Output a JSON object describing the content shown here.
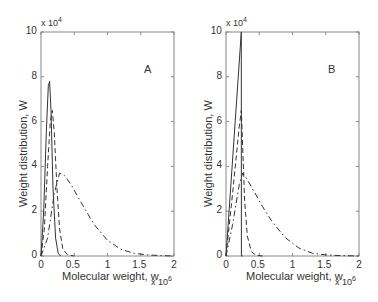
{
  "chart_data": [
    {
      "type": "line",
      "panel_label": "A",
      "xlabel": "Molecular weight, w",
      "x_multiplier": "x 10^6",
      "ylabel": "Weight distribution, W",
      "y_multiplier": "x 10^4",
      "xlim": [
        0,
        2
      ],
      "ylim": [
        0,
        10
      ],
      "xticks": [
        "0",
        "0.5",
        "1",
        "1.5",
        "2"
      ],
      "yticks": [
        "0",
        "2",
        "4",
        "6",
        "8",
        "10"
      ],
      "grid": false,
      "series": [
        {
          "name": "solid",
          "style": "solid",
          "x": [
            0,
            0.04,
            0.08,
            0.11,
            0.13,
            0.15,
            0.18,
            0.22,
            0.26,
            0.3
          ],
          "y": [
            0,
            2.0,
            5.5,
            7.6,
            7.8,
            6.5,
            3.0,
            0.8,
            0.1,
            0
          ]
        },
        {
          "name": "dashed",
          "style": "dashed",
          "x": [
            0,
            0.05,
            0.1,
            0.14,
            0.17,
            0.2,
            0.24,
            0.28,
            0.33,
            0.4,
            0.5
          ],
          "y": [
            0,
            1.2,
            4.0,
            6.0,
            6.5,
            5.5,
            3.0,
            1.2,
            0.3,
            0.05,
            0
          ]
        },
        {
          "name": "dash-dot",
          "style": "dashdot",
          "x": [
            0,
            0.1,
            0.2,
            0.28,
            0.35,
            0.45,
            0.6,
            0.8,
            1.0,
            1.2,
            1.4,
            1.6,
            1.8,
            2.0
          ],
          "y": [
            0,
            0.8,
            2.8,
            3.7,
            3.6,
            3.2,
            2.4,
            1.4,
            0.7,
            0.3,
            0.12,
            0.05,
            0.02,
            0
          ]
        }
      ]
    },
    {
      "type": "line",
      "panel_label": "B",
      "xlabel": "Molecular weight, w",
      "x_multiplier": "x 10^6",
      "ylabel": "Weight distribution, W",
      "y_multiplier": "x 10^4",
      "xlim": [
        0,
        2
      ],
      "ylim": [
        0,
        10
      ],
      "xticks": [
        "0",
        "0.5",
        "1",
        "1.5",
        "2"
      ],
      "yticks": [
        "0",
        "2",
        "4",
        "6",
        "8",
        "10"
      ],
      "grid": false,
      "series": [
        {
          "name": "solid",
          "style": "solid",
          "x": [
            0,
            0.23,
            0.231,
            0.25
          ],
          "y": [
            0,
            10.0,
            0,
            0
          ]
        },
        {
          "name": "dashed",
          "style": "dashed",
          "x": [
            0,
            0.1,
            0.2,
            0.23,
            0.25,
            0.28,
            0.32,
            0.38,
            0.45,
            0.55
          ],
          "y": [
            0,
            2.8,
            5.8,
            6.5,
            5.0,
            2.5,
            0.9,
            0.2,
            0.03,
            0
          ]
        },
        {
          "name": "dash-dot",
          "style": "dashdot",
          "x": [
            0,
            0.1,
            0.2,
            0.25,
            0.3,
            0.4,
            0.55,
            0.7,
            0.9,
            1.1,
            1.3,
            1.5,
            1.7,
            2.0
          ],
          "y": [
            0,
            1.4,
            3.2,
            3.7,
            3.5,
            3.0,
            2.2,
            1.5,
            0.8,
            0.35,
            0.12,
            0.05,
            0.02,
            0
          ]
        }
      ]
    }
  ]
}
